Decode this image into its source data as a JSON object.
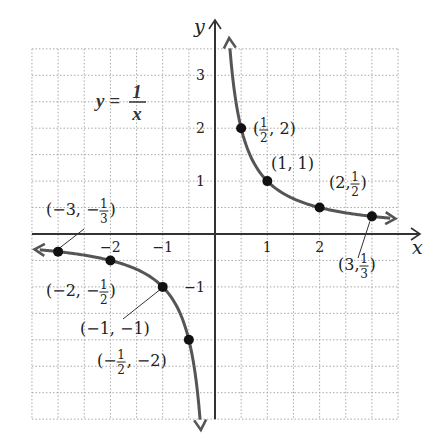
{
  "chart_data": {
    "type": "line",
    "equation": {
      "lhs": "y",
      "num": "1",
      "den": "x"
    },
    "xlabel": "x",
    "ylabel": "y",
    "xlim": [
      -3.5,
      3.5
    ],
    "ylim": [
      -3.5,
      3.5
    ],
    "grid": {
      "on": true,
      "step": 0.5,
      "style": "dotted"
    },
    "x_ticks": [
      {
        "value": -2,
        "label": "−2"
      },
      {
        "value": -1,
        "label": "−1"
      },
      {
        "value": 1,
        "label": "1"
      },
      {
        "value": 2,
        "label": "2"
      }
    ],
    "y_ticks": [
      {
        "value": 3,
        "label": "3"
      },
      {
        "value": 2,
        "label": "2"
      },
      {
        "value": 1,
        "label": "1"
      },
      {
        "value": -1,
        "label": "−1"
      }
    ],
    "series": [
      {
        "name": "y = 1/x (x > 0)",
        "x_range": [
          0.285,
          3.5
        ],
        "color": "#555555"
      },
      {
        "name": "y = 1/x (x < 0)",
        "x_range": [
          -3.5,
          -0.285
        ],
        "color": "#555555"
      }
    ],
    "points": [
      {
        "x": 0.5,
        "y": 2,
        "label": [
          "(",
          "1/2",
          ", 2)"
        ]
      },
      {
        "x": 1,
        "y": 1,
        "label": [
          "(1, 1)"
        ]
      },
      {
        "x": 2,
        "y": 0.5,
        "label": [
          "(2, ",
          "1/2",
          ")"
        ]
      },
      {
        "x": 3,
        "y": 0.3333,
        "label": [
          "(3, ",
          "1/3",
          ")"
        ]
      },
      {
        "x": -0.5,
        "y": -2,
        "label": [
          "(−",
          "1/2",
          ", −2)"
        ]
      },
      {
        "x": -1,
        "y": -1,
        "label": [
          "(−1, −1)"
        ]
      },
      {
        "x": -2,
        "y": -0.5,
        "label": [
          "(−2, −",
          "1/2",
          ")"
        ]
      },
      {
        "x": -3,
        "y": -0.3333,
        "label": [
          "(−3, −",
          "1/3",
          ")"
        ]
      }
    ],
    "colors": {
      "curve": "#555555",
      "axis": "#333333",
      "grid": "#a8a8a8",
      "point": "#111111"
    }
  }
}
